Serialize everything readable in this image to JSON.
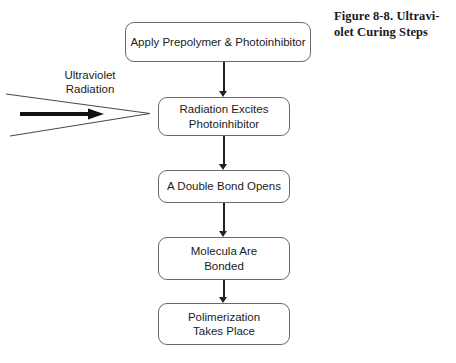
{
  "figure": {
    "caption_lines": [
      "Figure 8-8. Ultravi-",
      "olet Curing Steps"
    ],
    "caption_full": "Figure 8-8. Ultraviolet Curing Steps"
  },
  "diagram": {
    "type": "flowchart",
    "orientation": "vertical-top-to-bottom",
    "input_label": {
      "lines": [
        "Ultraviolet",
        "Radiation"
      ],
      "full": "Ultraviolet Radiation",
      "arrow": "right-pointing-thick-arrow-inside-converging-wedge",
      "target_step": 2
    },
    "steps": [
      {
        "id": 1,
        "lines": [
          "Apply Prepolymer & Photoinhibitor"
        ]
      },
      {
        "id": 2,
        "lines": [
          "Radiation Excites",
          "Photoinhibitor"
        ]
      },
      {
        "id": 3,
        "lines": [
          "A Double Bond Opens"
        ]
      },
      {
        "id": 4,
        "lines": [
          "Molecula Are",
          "Bonded"
        ]
      },
      {
        "id": 5,
        "lines": [
          "Polimerization",
          "Takes Place"
        ]
      }
    ],
    "connectors": [
      {
        "from": 1,
        "to": 2,
        "style": "arrow-down"
      },
      {
        "from": 2,
        "to": 3,
        "style": "arrow-down"
      },
      {
        "from": 3,
        "to": 4,
        "style": "arrow-down"
      },
      {
        "from": 4,
        "to": 5,
        "style": "arrow-down"
      }
    ]
  },
  "colors": {
    "background": "#ffffff",
    "box_border": "#6b6b6b",
    "text": "#1c1c1c",
    "caption_text": "#1a1a1a",
    "arrow": "#222222",
    "wedge_line": "#4a4a4a"
  }
}
